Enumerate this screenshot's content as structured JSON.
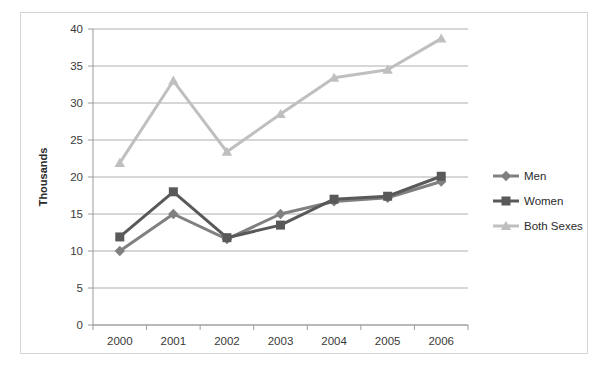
{
  "chart_data": {
    "type": "line",
    "title": "",
    "subtitle": "",
    "xlabel": "",
    "ylabel": "Thousands",
    "categories": [
      "2000",
      "2001",
      "2002",
      "2003",
      "2004",
      "2005",
      "2006"
    ],
    "x": [
      2000,
      2001,
      2002,
      2003,
      2004,
      2005,
      2006
    ],
    "ylim": [
      0,
      40
    ],
    "ytick_step": 5,
    "yticks": [
      0,
      5,
      10,
      15,
      20,
      25,
      30,
      35,
      40
    ],
    "ytick_labels": [
      "0",
      "5",
      "10",
      "15",
      "20",
      "25",
      "30",
      "35",
      "40"
    ],
    "grid": true,
    "grid_axis": "y",
    "legend_position": "right",
    "series": [
      {
        "name": "Men",
        "color": "#808080",
        "marker": "diamond",
        "values": [
          10.0,
          15.0,
          11.6,
          15.0,
          16.7,
          17.2,
          19.4
        ]
      },
      {
        "name": "Women",
        "color": "#595959",
        "marker": "square",
        "values": [
          11.9,
          18.0,
          11.8,
          13.5,
          17.0,
          17.4,
          20.1
        ]
      },
      {
        "name": "Both Sexes",
        "color": "#bfbfbf",
        "marker": "triangle",
        "values": [
          21.9,
          33.0,
          23.4,
          28.5,
          33.4,
          34.5,
          38.7
        ]
      }
    ]
  },
  "legend": {
    "items": [
      {
        "label": "Men"
      },
      {
        "label": "Women"
      },
      {
        "label": "Both Sexes"
      }
    ]
  },
  "colors": {
    "men": "#808080",
    "women": "#595959",
    "both_sexes": "#bfbfbf",
    "gridline": "#9a9a9a",
    "border": "#d4d4d4",
    "text": "#2b2b2b",
    "background": "#ffffff"
  }
}
